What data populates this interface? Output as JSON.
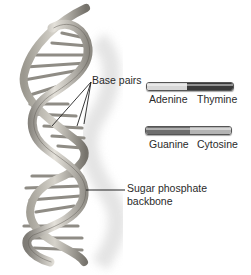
{
  "diagram": {
    "labels": {
      "base_pairs": "Base pairs",
      "backbone_line1": "Sugar phosphate",
      "backbone_line2": "backbone"
    },
    "legend": [
      {
        "pair": "A-T",
        "left": {
          "name": "Adenine",
          "color": "#d8d8d8"
        },
        "right": {
          "name": "Thymine",
          "color": "#3a3a3a"
        }
      },
      {
        "pair": "G-C",
        "left": {
          "name": "Guanine",
          "color": "#6e6e6e"
        },
        "right": {
          "name": "Cytosine",
          "color": "#b4b4b4"
        }
      }
    ],
    "colors": {
      "background": "#ffffff",
      "strand_light": "#d9d6cf",
      "strand_dark": "#8a8780",
      "rung": "#9a9790",
      "shadow": "#e6e6e6",
      "leader_line": "#222222"
    }
  }
}
